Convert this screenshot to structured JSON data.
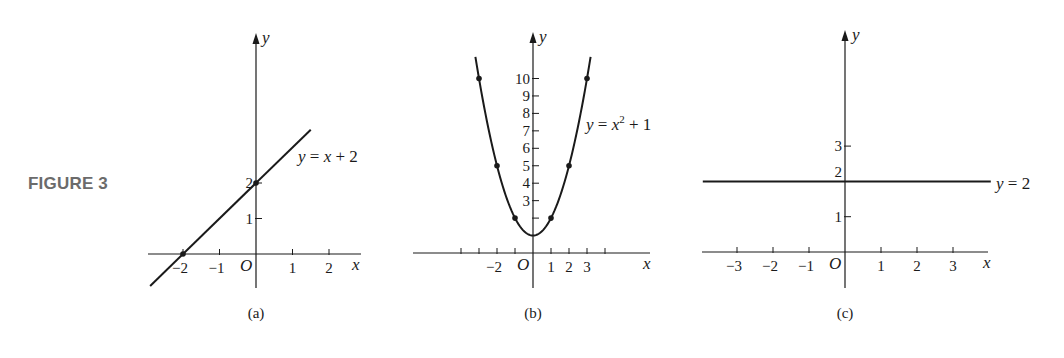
{
  "figure_label": "FIGURE 3",
  "colors": {
    "ink": "#1a1a1a",
    "figure_label": "#6b6b6b",
    "background": "#ffffff"
  },
  "chart_data": [
    {
      "type": "line",
      "panel": "(a)",
      "title": "y = x + 2",
      "equation": "y = x + 2",
      "xlabel": "x",
      "ylabel": "y",
      "origin_label": "O",
      "x_ticks": [
        -2,
        -1,
        1,
        2
      ],
      "x_tick_labels": [
        "−2",
        "−1",
        "1",
        "2"
      ],
      "y_ticks": [
        1,
        2
      ],
      "y_tick_labels": [
        "1",
        "2"
      ],
      "xlim": [
        -3,
        3
      ],
      "ylim": [
        -1,
        6
      ],
      "grid": false,
      "x": [
        -2.9,
        1.5
      ],
      "y": [
        -0.9,
        3.5
      ],
      "marked_points": [
        [
          -2,
          0
        ],
        [
          0,
          2
        ]
      ]
    },
    {
      "type": "line",
      "panel": "(b)",
      "title": "y = x^2 + 1",
      "equation": "y = x² + 1",
      "xlabel": "x",
      "ylabel": "y",
      "origin_label": "O",
      "x_ticks": [
        -4,
        -3,
        -2,
        -1,
        1,
        2,
        3,
        4
      ],
      "x_tick_labels": [
        "",
        "",
        "−2",
        "",
        "1",
        "2",
        "3",
        ""
      ],
      "y_ticks": [
        2,
        3,
        4,
        5,
        6,
        7,
        8,
        9,
        10
      ],
      "y_tick_labels": [
        "",
        "3",
        "4",
        "5",
        "6",
        "7",
        "8",
        "9",
        "10"
      ],
      "xlim": [
        -6.5,
        6.5
      ],
      "ylim": [
        -2,
        12
      ],
      "grid": false,
      "x": [
        -3.2,
        -3,
        -2,
        -1,
        0,
        1,
        2,
        3,
        3.2
      ],
      "y": [
        11.24,
        10,
        5,
        2,
        1,
        2,
        5,
        10,
        11.24
      ],
      "marked_points": [
        [
          -3,
          10
        ],
        [
          -2,
          5
        ],
        [
          -1,
          2
        ],
        [
          1,
          2
        ],
        [
          2,
          5
        ],
        [
          3,
          10
        ]
      ]
    },
    {
      "type": "line",
      "panel": "(c)",
      "title": "y = 2",
      "equation": "y = 2",
      "xlabel": "x",
      "ylabel": "y",
      "origin_label": "O",
      "x_ticks": [
        -3,
        -2,
        -1,
        1,
        2,
        3
      ],
      "x_tick_labels": [
        "−3",
        "−2",
        "−1",
        "1",
        "2",
        "3"
      ],
      "y_ticks": [
        1,
        3
      ],
      "y_tick_labels": [
        "1",
        "3"
      ],
      "y_extra_label": {
        "value": 2,
        "text": "2"
      },
      "xlim": [
        -4,
        4
      ],
      "ylim": [
        -1,
        6
      ],
      "grid": false,
      "x": [
        -3.95,
        4.05
      ],
      "y": [
        2,
        2
      ],
      "marked_points": []
    }
  ],
  "panels": {
    "a": {
      "caption": "(a)",
      "equation_parts": {
        "lhs": "y",
        "eq": " = ",
        "var": "x",
        "rest": " + 2"
      }
    },
    "b": {
      "caption": "(b)",
      "equation_parts": {
        "lhs": "y",
        "eq": " = ",
        "var": "x",
        "sup": "2",
        "rest": " + 1"
      }
    },
    "c": {
      "caption": "(c)",
      "equation_parts": {
        "lhs": "y",
        "eq": " = ",
        "rest": "2"
      }
    }
  }
}
